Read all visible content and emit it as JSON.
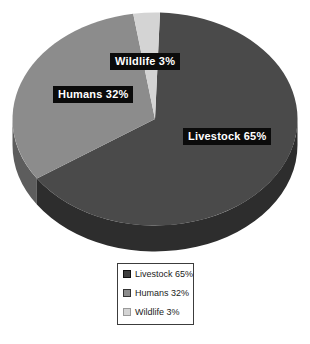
{
  "chart_data": {
    "type": "pie",
    "effect": "3d",
    "title": "",
    "unit": "%",
    "start_angle_deg": 2,
    "direction": "clockwise",
    "legend_position": "bottom-center",
    "background_color": "#ffffff",
    "label_box_color": "#0b0b0b",
    "label_text_color": "#ffffff",
    "categories": [
      "Livestock",
      "Humans",
      "Wildlife"
    ],
    "values": [
      65,
      32,
      3
    ],
    "slices": [
      {
        "label": "Livestock",
        "value": 65,
        "display": "Livestock 65%",
        "color_top": "#4a4a4a",
        "color_side": "#2d2d2d",
        "swatch_color": "#3f3f3f",
        "swatch_border": "#111111"
      },
      {
        "label": "Humans",
        "value": 32,
        "display": "Humans 32%",
        "color_top": "#8c8c8c",
        "color_side": "#5d5d5d",
        "swatch_color": "#8c8c8c",
        "swatch_border": "#333333"
      },
      {
        "label": "Wildlife",
        "value": 3,
        "display": "Wildlife 3%",
        "color_top": "#d4d4d4",
        "color_side": "#b3b3b3",
        "swatch_color": "#d4d4d4",
        "swatch_border": "#9a9a9a"
      }
    ]
  }
}
